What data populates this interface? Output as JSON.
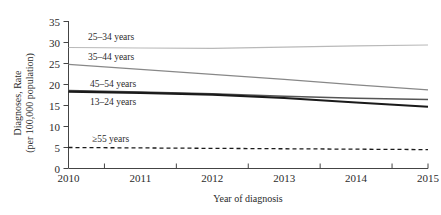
{
  "chart_data": {
    "type": "line",
    "title": "",
    "xlabel": "Year of diagnosis",
    "ylabel": "Diagnoses, Rate",
    "ylabel_line2": "(per 100,000 population)",
    "x": [
      2010,
      2011,
      2012,
      2013,
      2014,
      2015
    ],
    "xtick_labels": [
      "2010",
      "2011",
      "2012",
      "2013",
      "2014",
      "2015"
    ],
    "ytick_labels": [
      "0",
      "5",
      "10",
      "15",
      "20",
      "25",
      "30",
      "35"
    ],
    "ytick_values": [
      0,
      5,
      10,
      15,
      20,
      25,
      30,
      35
    ],
    "ylim": [
      0,
      35
    ],
    "xlim": [
      2010,
      2015
    ],
    "grid": false,
    "legend_position": "inline-labels",
    "series": [
      {
        "name": "25–34 years",
        "label": "25–34 years",
        "values": [
          28.8,
          28.7,
          28.6,
          28.9,
          29.2,
          29.4
        ],
        "color": "#b9b9b9",
        "width": 1.1,
        "dash": "none"
      },
      {
        "name": "35–44 years",
        "label": "35–44 years",
        "values": [
          24.8,
          23.6,
          22.4,
          21.2,
          19.9,
          18.7
        ],
        "color": "#888888",
        "width": 1.3,
        "dash": "none"
      },
      {
        "name": "45–54 years",
        "label": "45–54 years",
        "values": [
          18.6,
          18.2,
          17.8,
          17.2,
          16.7,
          16.4
        ],
        "color": "#555555",
        "width": 1.5,
        "dash": "none"
      },
      {
        "name": "13–24 years",
        "label": "13–24 years",
        "values": [
          18.3,
          18.0,
          17.6,
          16.8,
          15.7,
          14.7
        ],
        "color": "#1a1a1a",
        "width": 2.1,
        "dash": "none"
      },
      {
        "name": "≥55 years",
        "label": "≥55 years",
        "values": [
          5.0,
          4.9,
          4.8,
          4.7,
          4.6,
          4.5
        ],
        "color": "#1a1a1a",
        "width": 1.3,
        "dash": "4,3"
      }
    ],
    "series_label_positions": [
      {
        "label_index": 0,
        "x": 88,
        "y": 40
      },
      {
        "label_index": 1,
        "x": 88,
        "y": 60
      },
      {
        "label_index": 2,
        "x": 90,
        "y": 87
      },
      {
        "label_index": 3,
        "x": 90,
        "y": 105
      },
      {
        "label_index": 4,
        "x": 92,
        "y": 142
      }
    ]
  },
  "axis": {
    "x_title": "Year of diagnosis",
    "y_title_line1": "Diagnoses, Rate",
    "y_title_line2": "(per 100,000 population)"
  }
}
